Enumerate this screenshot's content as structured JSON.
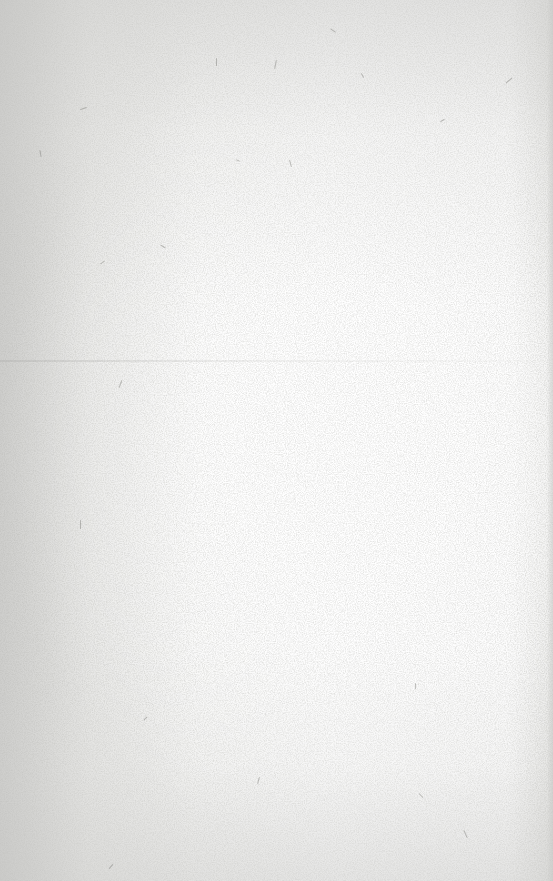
{
  "scene": {
    "description": "Blank sheet of textured paper",
    "paper_color": "#fdfdfd",
    "edge_shade_color": "#d8d8d6",
    "fiber_color": "#7a7a74",
    "crease_y": 360,
    "text": ""
  }
}
